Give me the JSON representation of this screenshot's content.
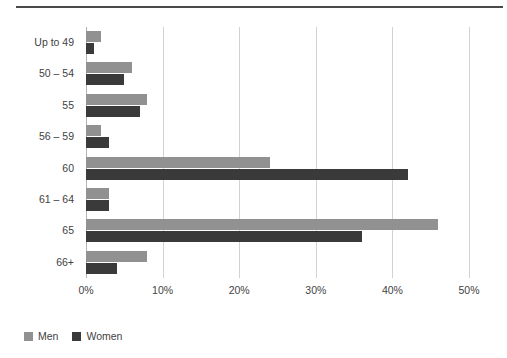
{
  "chart_data": {
    "type": "bar",
    "orientation": "horizontal",
    "title": "",
    "subtitle": "",
    "xlabel": "",
    "ylabel": "",
    "categories": [
      "Up to 49",
      "50 – 54",
      "55",
      "56 – 59",
      "60",
      "61 – 64",
      "65",
      "66+"
    ],
    "series": [
      {
        "name": "Men",
        "color": "#919191",
        "values": [
          2,
          6,
          8,
          2,
          24,
          3,
          46,
          8
        ]
      },
      {
        "name": "Women",
        "color": "#3a3a3a",
        "values": [
          1,
          5,
          7,
          3,
          42,
          3,
          36,
          4
        ]
      }
    ],
    "xlim": [
      0,
      50
    ],
    "xticks": [
      0,
      10,
      20,
      30,
      40,
      50
    ],
    "xtick_labels": [
      "0%",
      "10%",
      "20%",
      "30%",
      "40%",
      "50%"
    ],
    "grid": "vertical",
    "legend_position": "bottom-left",
    "value_suffix": "%"
  },
  "legend": {
    "entries": [
      {
        "label": "Men",
        "swatch": "men-swatch"
      },
      {
        "label": "Women",
        "swatch": "women-swatch"
      }
    ]
  },
  "colors": {
    "men": "#919191",
    "women": "#3a3a3a",
    "gridline": "#d2d2d2",
    "axis": "#b4b4b4",
    "text": "#3f3f3f",
    "rule": "#4a4a4a",
    "background": "#ffffff"
  }
}
